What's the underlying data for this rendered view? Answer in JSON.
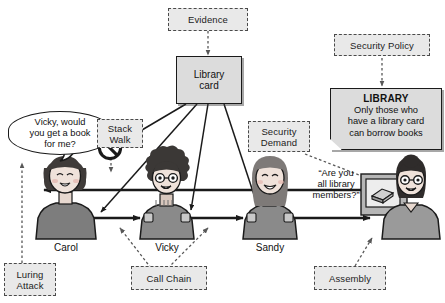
{
  "diagram": {
    "colors": {
      "annotation_fill": "#e9e9e9",
      "annotation_border": "#4a4a4a",
      "entity_fill": "#dcdcdc",
      "entity_border": "#1a1a1a",
      "line": "#1a1a1a",
      "skin": "#efe2da",
      "hair_dark": "#3d3a38",
      "shirt": "#8e8e8e"
    },
    "annotations": [
      {
        "id": "evidence",
        "label": "Evidence"
      },
      {
        "id": "security-policy",
        "label": "Security Policy"
      },
      {
        "id": "stack-walk",
        "label": "Stack\nWalk",
        "line1": "Stack",
        "line2": "Walk"
      },
      {
        "id": "security-demand",
        "label": "Security\nDemand",
        "line1": "Security",
        "line2": "Demand"
      },
      {
        "id": "luring-attack",
        "label": "Luring\nAttack",
        "line1": "Luring",
        "line2": "Attack"
      },
      {
        "id": "call-chain",
        "label": "Call Chain"
      },
      {
        "id": "assembly",
        "label": "Assembly"
      }
    ],
    "entities": {
      "library_card": {
        "line1": "Library",
        "line2": "card"
      },
      "library_note": {
        "title": "LIBRARY",
        "line1": "Only those who",
        "line2": "have a library card",
        "line3": "can borrow books"
      }
    },
    "speech": {
      "carol_bubble": {
        "line1": "Vicky, would",
        "line2": "you get a book",
        "line3": "for me?"
      },
      "librarian_quote": {
        "line1": "“Are you",
        "line2": "all library",
        "line3": "members?”"
      }
    },
    "actors": [
      {
        "id": "carol",
        "name": "Carol"
      },
      {
        "id": "vicky",
        "name": "Vicky"
      },
      {
        "id": "sandy",
        "name": "Sandy"
      },
      {
        "id": "librarian",
        "name": ""
      }
    ],
    "symbols": [
      {
        "id": "no-entry",
        "name": "prohibition-sign"
      }
    ],
    "caption": ""
  }
}
